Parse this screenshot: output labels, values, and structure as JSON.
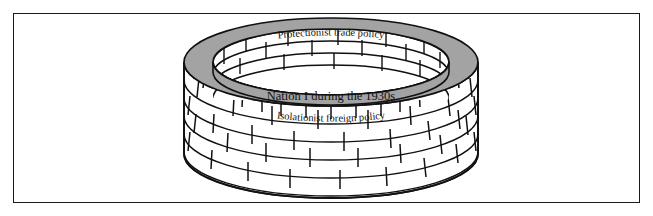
{
  "figure": {
    "title_top": "Protectionist trade policy",
    "label_center": "Nation I during the 1930s",
    "label_front": "Isolationist foreign policy"
  },
  "colors": {
    "frame_border": "#1a1a1a",
    "background": "#ffffff",
    "rim_gray": "#a3a3a3",
    "rim_gray_dark": "#8d8d8d",
    "brick_fill": "#ffffff",
    "brick_stroke": "#111111",
    "text": "#111111"
  },
  "geometry": {
    "frame_x": 13,
    "frame_y": 13,
    "frame_w": 627,
    "frame_h": 190,
    "center_x": 331,
    "top_rim_cy": 62,
    "rx_outer": 147,
    "ry_outer": 44,
    "rx_inner": 118,
    "ry_inner": 33,
    "wall_height": 92
  }
}
